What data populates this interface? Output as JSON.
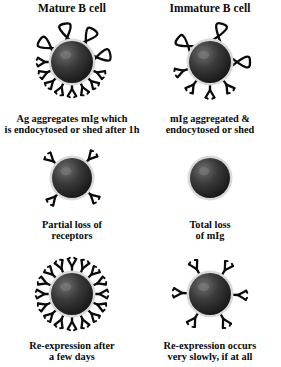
{
  "figure": {
    "title_left": "Mature B cell",
    "title_right": "Immature B cell",
    "background_color": "#ffffff",
    "ink_color": "#0a0a0a",
    "cell_body_color": "#2b2b2b",
    "cell_halo_color": "#d9d9d9"
  },
  "columns": [
    {
      "id": "mature",
      "heading": "Mature B cell",
      "rows": [
        {
          "id": "mature-crosslinked",
          "caption_lines": [
            "Ag aggregates mIg which",
            "is endocytosed or shed after 1h"
          ],
          "receptor_count": 16,
          "crosslinked_pairs": 4,
          "state": "receptors-crosslinked-by-antigen"
        },
        {
          "id": "mature-partial-loss",
          "caption_lines": [
            "Partial loss of",
            "receptors"
          ],
          "receptor_count": 4,
          "crosslinked_pairs": 0,
          "state": "partial-receptor-loss"
        },
        {
          "id": "mature-reexpression",
          "caption_lines": [
            "Re-expression after",
            "a few days"
          ],
          "receptor_count": 16,
          "crosslinked_pairs": 0,
          "state": "full-receptor-reexpression"
        }
      ]
    },
    {
      "id": "immature",
      "heading": "Immature B cell",
      "rows": [
        {
          "id": "immature-crosslinked",
          "caption_lines": [
            "mIg aggregated &",
            "endocytosed or shed"
          ],
          "receptor_count": 10,
          "crosslinked_pairs": 3,
          "state": "receptors-crosslinked-by-antigen"
        },
        {
          "id": "immature-total-loss",
          "caption_lines": [
            "Total loss",
            "of mIg"
          ],
          "receptor_count": 0,
          "crosslinked_pairs": 0,
          "state": "total-receptor-loss"
        },
        {
          "id": "immature-reexpression",
          "caption_lines": [
            "Re-expression occurs",
            "very slowly, if at all"
          ],
          "receptor_count": 6,
          "crosslinked_pairs": 0,
          "state": "slow-partial-reexpression"
        }
      ]
    }
  ]
}
